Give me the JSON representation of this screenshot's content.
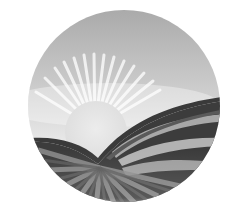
{
  "image": {
    "alt": "Circular grayscale logo of a sun rising over striped rolling fields",
    "elements": [
      "sky",
      "sun-rays",
      "sun",
      "striped-fields"
    ]
  },
  "colors": {
    "background": "#ffffff",
    "sky_top": "#a9a9a9",
    "sky_bottom": "#f2f2f2",
    "sun": "#e6e6e6",
    "stripe_dark": "#3a3a3a",
    "stripe_mid": "#6e6e6e",
    "stripe_light": "#b5b5b5"
  }
}
